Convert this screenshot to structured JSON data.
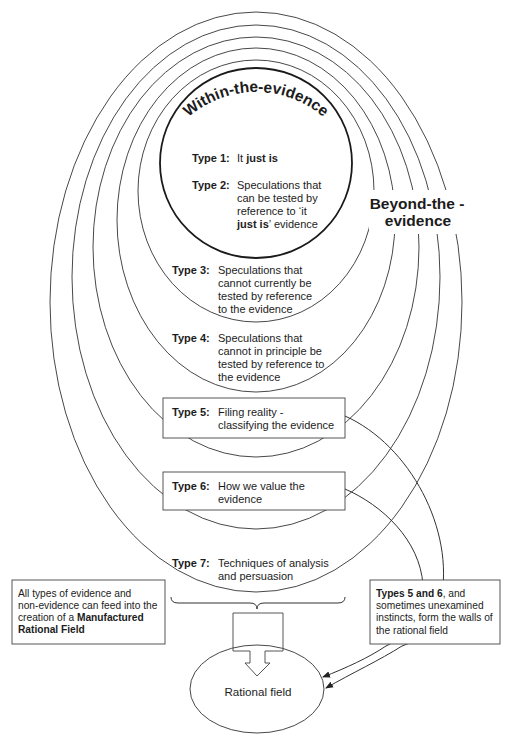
{
  "colors": {
    "stroke": "#333333",
    "text": "#1c1c1c",
    "background": "#ffffff"
  },
  "inner_title": "Within-the-evidence",
  "outer_title": {
    "line1": "Beyond-the -",
    "line2": "evidence"
  },
  "types": [
    {
      "label": "Type 1:",
      "lines": [
        {
          "pre": "It ",
          "bold": "just is",
          "post": ""
        }
      ]
    },
    {
      "label": "Type 2:",
      "lines": [
        {
          "pre": "Speculations that"
        },
        {
          "pre": "can be tested by"
        },
        {
          "pre": "reference to ‘it"
        },
        {
          "pre": "",
          "bold": "just is",
          "post": "’ evidence"
        }
      ]
    },
    {
      "label": "Type 3:",
      "lines": [
        {
          "pre": "Speculations that"
        },
        {
          "pre": "cannot currently be"
        },
        {
          "pre": "tested by reference"
        },
        {
          "pre": "to the evidence"
        }
      ]
    },
    {
      "label": "Type 4:",
      "lines": [
        {
          "pre": "Speculations that"
        },
        {
          "pre": "cannot in principle be"
        },
        {
          "pre": "tested by reference to"
        },
        {
          "pre": "the evidence"
        }
      ]
    },
    {
      "label": "Type 5:",
      "lines": [
        {
          "pre": "Filing reality -"
        },
        {
          "pre": "classifying the evidence"
        }
      ]
    },
    {
      "label": "Type 6:",
      "lines": [
        {
          "pre": "How we value the"
        },
        {
          "pre": "evidence"
        }
      ]
    },
    {
      "label": "Type 7:",
      "lines": [
        {
          "pre": "Techniques of analysis"
        },
        {
          "pre": "and persuasion"
        }
      ]
    }
  ],
  "left_note": {
    "lines": [
      {
        "pre": "All types of evidence and"
      },
      {
        "pre": "non-evidence can feed into the"
      },
      {
        "pre": "creation of a ",
        "bold": "Manufactured"
      },
      {
        "pre": "",
        "bold": "Rational Field"
      }
    ]
  },
  "right_note": {
    "lines": [
      {
        "pre": "",
        "bold": "Types 5 and 6",
        "post": ", and"
      },
      {
        "pre": "sometimes unexamined"
      },
      {
        "pre": "instincts, form the walls of"
      },
      {
        "pre": "the rational field"
      }
    ]
  },
  "rational_field": {
    "label": "Rational field"
  }
}
